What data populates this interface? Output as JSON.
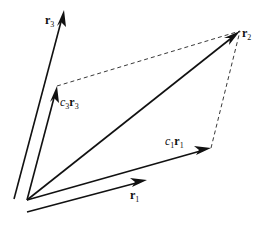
{
  "diagram": {
    "colors": {
      "stroke": "#111111",
      "background": "#ffffff"
    },
    "labels": {
      "r3": {
        "base": "r",
        "sub": "3"
      },
      "r2": {
        "base": "r",
        "sub": "2"
      },
      "c3r3": {
        "coef": "c",
        "coef_sub": "3",
        "base": "r",
        "sub": "3"
      },
      "c1r1": {
        "coef": "c",
        "coef_sub": "1",
        "base": "r",
        "sub": "1"
      },
      "r1": {
        "base": "r",
        "sub": "1"
      }
    },
    "vectors": [
      {
        "name": "r3",
        "style": "solid",
        "from": [
          14,
          199
        ],
        "to": [
          64,
          10
        ]
      },
      {
        "name": "c3r3",
        "style": "solid",
        "from": [
          27,
          200
        ],
        "to": [
          57,
          86
        ]
      },
      {
        "name": "r2",
        "style": "solid",
        "from": [
          27,
          200
        ],
        "to": [
          240,
          31
        ]
      },
      {
        "name": "c1r1",
        "style": "solid",
        "from": [
          27,
          200
        ],
        "to": [
          211,
          148
        ]
      },
      {
        "name": "r1",
        "style": "solid",
        "from": [
          27,
          212
        ],
        "to": [
          147,
          180
        ]
      }
    ],
    "dashed_lines": [
      {
        "from": [
          57,
          86
        ],
        "to": [
          240,
          31
        ]
      },
      {
        "from": [
          211,
          148
        ],
        "to": [
          240,
          31
        ]
      }
    ]
  }
}
